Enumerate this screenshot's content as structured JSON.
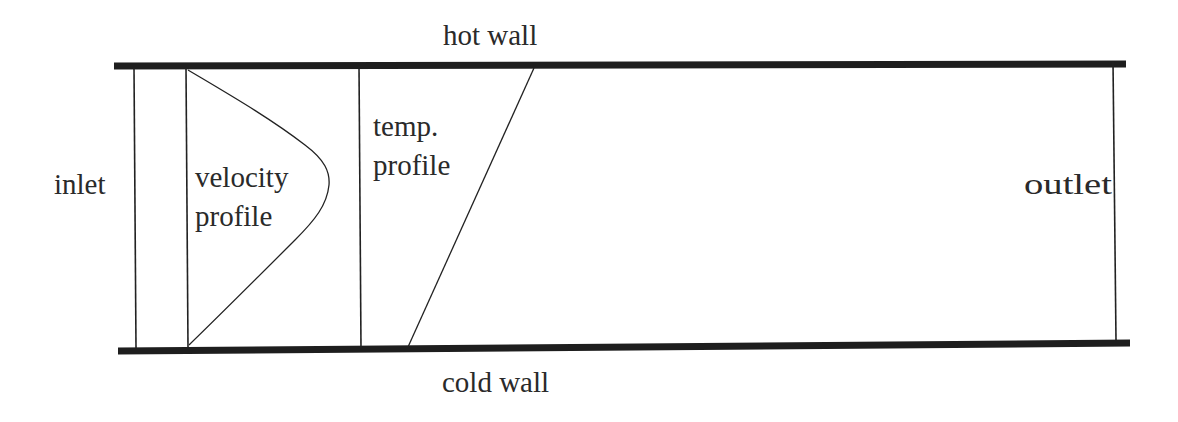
{
  "labels": {
    "hot_wall": "hot wall",
    "cold_wall": "cold wall",
    "inlet": "inlet",
    "outlet": "outlet",
    "velocity_line1": "velocity",
    "velocity_line2": "profile",
    "temp_line1": "temp.",
    "temp_line2": "profile"
  },
  "colors": {
    "wall": "#1e1e1e",
    "line": "#222222",
    "text": "#2a2a2a",
    "background": "#ffffff"
  },
  "geometry": {
    "hot_wall": {
      "x1": 114,
      "y1": 66,
      "x2": 1126,
      "y2": 64,
      "width": 7
    },
    "cold_wall": {
      "x1": 118,
      "y1": 351,
      "x2": 1130,
      "y2": 343,
      "width": 7
    },
    "inlet_line": {
      "x1": 134,
      "y1": 68,
      "x2": 136,
      "y2": 348
    },
    "velocity_baseline": {
      "x1": 186,
      "y1": 68,
      "x2": 188,
      "y2": 348
    },
    "temp_baseline": {
      "x1": 359,
      "y1": 66,
      "x2": 361,
      "y2": 348
    },
    "outlet_line": {
      "x1": 1113,
      "y1": 62,
      "x2": 1116,
      "y2": 340
    },
    "temp_profile": {
      "x1": 534,
      "y1": 68,
      "x2": 408,
      "y2": 347
    }
  }
}
